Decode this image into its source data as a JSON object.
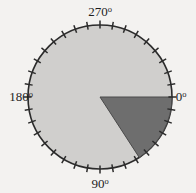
{
  "figure": {
    "name": "circular-angle-dial",
    "background_color": "#f3f2f0",
    "disk": {
      "fill_color": "#d0cfcd",
      "stroke_color": "#2b2b2b",
      "center_x": 100,
      "center_y": 97,
      "radius": 72
    },
    "ticks": {
      "count": 36,
      "interval_degrees": 10,
      "length": 8,
      "color": "#2b2b2b"
    },
    "wedge": {
      "fill_color": "#6e6e6e",
      "stroke_color": "#4a4a4a",
      "start_angle": 0,
      "end_angle": 57,
      "direction": "clockwise"
    },
    "labels": [
      {
        "id": "label-270",
        "text": "270",
        "degree_symbol": "o",
        "angle": 270,
        "x": 100,
        "y": 16,
        "anchor": "middle"
      },
      {
        "id": "label-180",
        "text": "180",
        "degree_symbol": "o",
        "angle": 180,
        "x": 21,
        "y": 101,
        "anchor": "middle"
      },
      {
        "id": "label-0",
        "text": "0",
        "degree_symbol": "o",
        "angle": 0,
        "x": 181,
        "y": 101,
        "anchor": "middle"
      },
      {
        "id": "label-90",
        "text": "90",
        "degree_symbol": "o",
        "angle": 90,
        "x": 100,
        "y": 188,
        "anchor": "middle"
      }
    ]
  },
  "chart_data": {
    "type": "pie",
    "title": "",
    "xlabel": "",
    "ylabel": "",
    "categories": [
      "highlighted sector",
      "remainder"
    ],
    "values": [
      57,
      303
    ],
    "value_unit": "degrees",
    "colors": [
      "#6e6e6e",
      "#d0cfcd"
    ],
    "axis": {
      "kind": "polar-degrees",
      "range": [
        0,
        360
      ],
      "tick_interval": 10,
      "labeled_ticks": [
        0,
        90,
        180,
        270
      ],
      "tick_labels": [
        "0o",
        "90o",
        "180o",
        "270o"
      ],
      "zero_position": "east",
      "direction": "clockwise",
      "grid": false
    },
    "legend": {
      "show": false,
      "position": "none"
    },
    "annotations": [
      {
        "text": "0o",
        "at_degrees": 0
      },
      {
        "text": "90o",
        "at_degrees": 90
      },
      {
        "text": "180o",
        "at_degrees": 180
      },
      {
        "text": "270o",
        "at_degrees": 270
      }
    ]
  }
}
